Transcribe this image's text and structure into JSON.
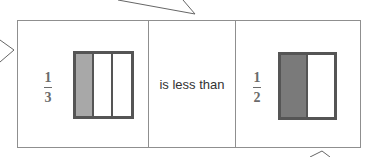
{
  "comparison": {
    "left": {
      "numerator": "1",
      "denominator": "3",
      "model": {
        "parts": 3,
        "shaded": 1,
        "shade_color": "#a8a8a8"
      }
    },
    "phrase": "is less than",
    "right": {
      "numerator": "1",
      "denominator": "2",
      "model": {
        "parts": 2,
        "shaded": 1,
        "shade_color": "#7a7a7a"
      }
    }
  },
  "colors": {
    "border": "#8f8f8f",
    "model_outline": "#555555",
    "fraction_text": "#6b6b6b"
  }
}
